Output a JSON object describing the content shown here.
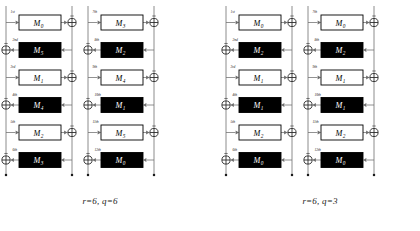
{
  "figure": {
    "ordinals": [
      "1st",
      "2nd",
      "3rd",
      "4th",
      "5th",
      "6th",
      "7th",
      "8th",
      "9th",
      "10th",
      "11th",
      "12th"
    ],
    "module_prefix": "M",
    "colors": {
      "line": "#6e6e6e",
      "box_stroke": "#000000",
      "box_dark_fill": "#000000",
      "box_light_fill": "#ffffff",
      "text_on_dark": "#ffffff",
      "text_on_light": "#000000",
      "caption": "#1a1a1a"
    },
    "groups": [
      {
        "id": "group-left",
        "caption": "r=6, q=6",
        "r": 6,
        "q": 6,
        "columns": [
          {
            "id": "left-col-1",
            "rows": [
              {
                "ordinal": "1st",
                "module": "M",
                "subscript": "0",
                "style": "light",
                "direction": "ltr"
              },
              {
                "ordinal": "2nd",
                "module": "M",
                "subscript": "5",
                "style": "dark",
                "direction": "rtl"
              },
              {
                "ordinal": "3rd",
                "module": "M",
                "subscript": "1",
                "style": "light",
                "direction": "ltr"
              },
              {
                "ordinal": "4th",
                "module": "M",
                "subscript": "4",
                "style": "dark",
                "direction": "rtl"
              },
              {
                "ordinal": "5th",
                "module": "M",
                "subscript": "2",
                "style": "light",
                "direction": "ltr"
              },
              {
                "ordinal": "6th",
                "module": "M",
                "subscript": "3",
                "style": "dark",
                "direction": "rtl"
              }
            ]
          },
          {
            "id": "left-col-2",
            "rows": [
              {
                "ordinal": "7th",
                "module": "M",
                "subscript": "3",
                "style": "light",
                "direction": "ltr"
              },
              {
                "ordinal": "8th",
                "module": "M",
                "subscript": "2",
                "style": "dark",
                "direction": "rtl"
              },
              {
                "ordinal": "9th",
                "module": "M",
                "subscript": "4",
                "style": "light",
                "direction": "ltr"
              },
              {
                "ordinal": "10th",
                "module": "M",
                "subscript": "1",
                "style": "dark",
                "direction": "rtl"
              },
              {
                "ordinal": "11th",
                "module": "M",
                "subscript": "5",
                "style": "light",
                "direction": "ltr"
              },
              {
                "ordinal": "12th",
                "module": "M",
                "subscript": "0",
                "style": "dark",
                "direction": "rtl"
              }
            ]
          }
        ]
      },
      {
        "id": "group-right",
        "caption": "r=6, q=3",
        "r": 6,
        "q": 3,
        "columns": [
          {
            "id": "right-col-1",
            "rows": [
              {
                "ordinal": "1st",
                "module": "M",
                "subscript": "0",
                "style": "light",
                "direction": "ltr"
              },
              {
                "ordinal": "2nd",
                "module": "M",
                "subscript": "2",
                "style": "dark",
                "direction": "rtl"
              },
              {
                "ordinal": "3rd",
                "module": "M",
                "subscript": "1",
                "style": "light",
                "direction": "ltr"
              },
              {
                "ordinal": "4th",
                "module": "M",
                "subscript": "1",
                "style": "dark",
                "direction": "rtl"
              },
              {
                "ordinal": "5th",
                "module": "M",
                "subscript": "2",
                "style": "light",
                "direction": "ltr"
              },
              {
                "ordinal": "6th",
                "module": "M",
                "subscript": "0",
                "style": "dark",
                "direction": "rtl"
              }
            ]
          },
          {
            "id": "right-col-2",
            "rows": [
              {
                "ordinal": "7th",
                "module": "M",
                "subscript": "0",
                "style": "light",
                "direction": "ltr"
              },
              {
                "ordinal": "8th",
                "module": "M",
                "subscript": "2",
                "style": "dark",
                "direction": "rtl"
              },
              {
                "ordinal": "9th",
                "module": "M",
                "subscript": "1",
                "style": "light",
                "direction": "ltr"
              },
              {
                "ordinal": "10th",
                "module": "M",
                "subscript": "1",
                "style": "dark",
                "direction": "rtl"
              },
              {
                "ordinal": "11th",
                "module": "M",
                "subscript": "2",
                "style": "light",
                "direction": "ltr"
              },
              {
                "ordinal": "12th",
                "module": "M",
                "subscript": "0",
                "style": "dark",
                "direction": "rtl"
              }
            ]
          }
        ]
      }
    ]
  }
}
